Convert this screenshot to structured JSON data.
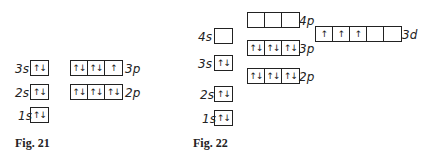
{
  "fig21": {
    "caption": "Fig. 21",
    "orbitals": [
      {
        "label": "3s",
        "cells": [
          "↑↓"
        ]
      },
      {
        "label": "2s",
        "cells": [
          "↑↓"
        ]
      },
      {
        "label": "1s",
        "cells": [
          "↑↓"
        ]
      },
      {
        "label": "3p",
        "cells": [
          "↑↓",
          "↑↓",
          "↑"
        ]
      },
      {
        "label": "2p",
        "cells": [
          "↑↓",
          "↑↓",
          "↑↓"
        ]
      }
    ]
  },
  "fig22": {
    "caption": "Fig. 22",
    "orbitals": [
      {
        "label": "4s",
        "cells": [
          ""
        ]
      },
      {
        "label": "3s",
        "cells": [
          "↑↓"
        ]
      },
      {
        "label": "2s",
        "cells": [
          "↑↓"
        ]
      },
      {
        "label": "1s",
        "cells": [
          "↑↓"
        ]
      },
      {
        "label": "4p",
        "cells": [
          "",
          "",
          ""
        ]
      },
      {
        "label": "3p",
        "cells": [
          "↑↓",
          "↑↓",
          "↑↓"
        ]
      },
      {
        "label": "2p",
        "cells": [
          "↑↓",
          "↑↓",
          "↑↓"
        ]
      },
      {
        "label": "3d",
        "cells": [
          "↑",
          "↑",
          "↑",
          "",
          ""
        ]
      }
    ]
  }
}
